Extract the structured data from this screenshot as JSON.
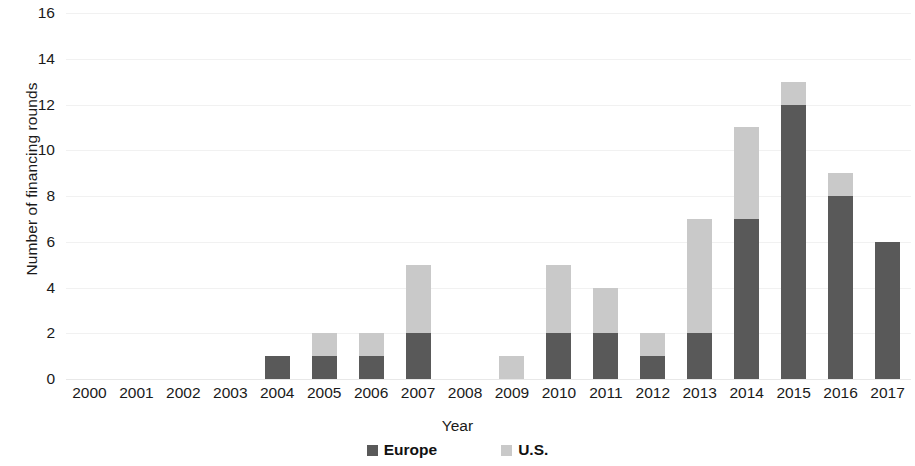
{
  "chart_data": {
    "type": "bar",
    "subtype": "stacked-column",
    "title": "",
    "xlabel": "Year",
    "ylabel": "Number of financing rounds",
    "categories": [
      "2000",
      "2001",
      "2002",
      "2003",
      "2004",
      "2005",
      "2006",
      "2007",
      "2008",
      "2009",
      "2010",
      "2011",
      "2012",
      "2013",
      "2014",
      "2015",
      "2016",
      "2017"
    ],
    "series": [
      {
        "name": "Europe",
        "color": "#595959",
        "values": [
          0,
          0,
          0,
          0,
          1,
          1,
          1,
          2,
          0,
          0,
          2,
          2,
          1,
          2,
          7,
          12,
          8,
          6
        ]
      },
      {
        "name": "U.S.",
        "color": "#c9c9c9",
        "values": [
          0,
          0,
          0,
          0,
          0,
          1,
          1,
          3,
          0,
          1,
          3,
          2,
          1,
          5,
          4,
          1,
          1,
          0
        ]
      }
    ],
    "totals": [
      0,
      0,
      0,
      0,
      1,
      2,
      2,
      5,
      0,
      1,
      5,
      4,
      2,
      7,
      11,
      13,
      9,
      6
    ],
    "ylim": [
      0,
      16
    ],
    "ytick_step": 2,
    "yticks": [
      "16",
      "14",
      "12",
      "10",
      "8",
      "6",
      "4",
      "2",
      "0"
    ],
    "ytick_values": [
      16,
      14,
      12,
      10,
      8,
      6,
      4,
      2,
      0
    ],
    "grid": "horizontal",
    "legend_position": "bottom",
    "legend": [
      {
        "label": "Europe",
        "color": "#595959"
      },
      {
        "label": "U.S.",
        "color": "#c9c9c9"
      }
    ]
  },
  "axes": {
    "y_title": "Number of financing rounds",
    "x_title": "Year"
  },
  "colors": {
    "europe": "#595959",
    "us": "#c9c9c9",
    "gridline": "#f1f1f1",
    "text": "#1a1a1a",
    "background": "#ffffff"
  }
}
